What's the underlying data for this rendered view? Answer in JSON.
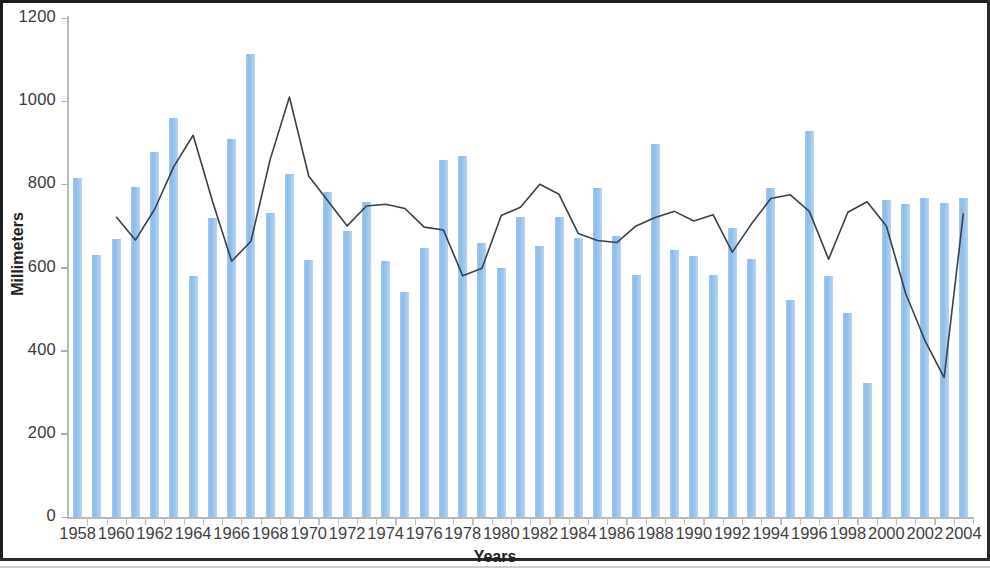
{
  "chart_data": {
    "type": "bar",
    "title": "",
    "xlabel": "Years",
    "ylabel": "Millimeters",
    "ylim": [
      0,
      1200
    ],
    "yticks": [
      0,
      200,
      400,
      600,
      800,
      1000,
      1200
    ],
    "ytick_labels": [
      "0",
      "200",
      "400",
      "600",
      "800",
      "1000",
      "1200"
    ],
    "grid": false,
    "legend": "none",
    "bar_color": "#8cbbe8",
    "line_color": "#3a3f4a",
    "categories": [
      "1958",
      "1959",
      "1960",
      "1961",
      "1962",
      "1963",
      "1964",
      "1965",
      "1966",
      "1967",
      "1968",
      "1969",
      "1970",
      "1971",
      "1972",
      "1973",
      "1974",
      "1975",
      "1976",
      "1977",
      "1978",
      "1979",
      "1980",
      "1981",
      "1982",
      "1983",
      "1984",
      "1985",
      "1986",
      "1987",
      "1988",
      "1989",
      "1990",
      "1991",
      "1992",
      "1993",
      "1994",
      "1995",
      "1996",
      "1997",
      "1998",
      "1999",
      "2000",
      "2001",
      "2002",
      "2003",
      "2004"
    ],
    "xtick_labels": [
      "1958",
      "1960",
      "1962",
      "1964",
      "1966",
      "1968",
      "1970",
      "1972",
      "1974",
      "1976",
      "1978",
      "1980",
      "1982",
      "1984",
      "1986",
      "1988",
      "1990",
      "1992",
      "1994",
      "1996",
      "1998",
      "2000",
      "2002",
      "2004"
    ],
    "series": [
      {
        "name": "Annual rainfall",
        "type": "bar",
        "values": [
          816,
          630,
          668,
          793,
          877,
          960,
          580,
          720,
          910,
          1113,
          730,
          824,
          617,
          781,
          688,
          757,
          615,
          540,
          648,
          858,
          868,
          659,
          600,
          722,
          651,
          722,
          670,
          792,
          676,
          582,
          898,
          643,
          627,
          583,
          695,
          620,
          792,
          523,
          928,
          580,
          490,
          322,
          762,
          753,
          766,
          756,
          766
        ]
      },
      {
        "name": "5-year moving average",
        "type": "line",
        "start_index": 2,
        "values": [
          null,
          null,
          722,
          666,
          740,
          843,
          918,
          760,
          615,
          663,
          860,
          1010,
          820,
          760,
          700,
          748,
          752,
          742,
          697,
          690,
          580,
          598,
          725,
          745,
          800,
          776,
          682,
          665,
          660,
          700,
          720,
          735,
          712,
          727,
          637,
          705,
          766,
          775,
          735,
          620,
          733,
          758,
          700,
          538,
          425,
          335,
          730
        ]
      }
    ]
  }
}
